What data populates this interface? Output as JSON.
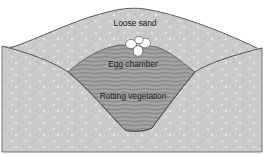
{
  "diagram": {
    "labels": {
      "top": "Loose sand",
      "middle": "Egg chamber",
      "bottom": "Rotting vegetation"
    },
    "colors": {
      "sand": "#c9c9c9",
      "vegetation": "#9a9a9a",
      "outline": "#4a4a4a",
      "eggs": "#ffffff",
      "background": "#ffffff"
    },
    "egg_count": 4
  }
}
